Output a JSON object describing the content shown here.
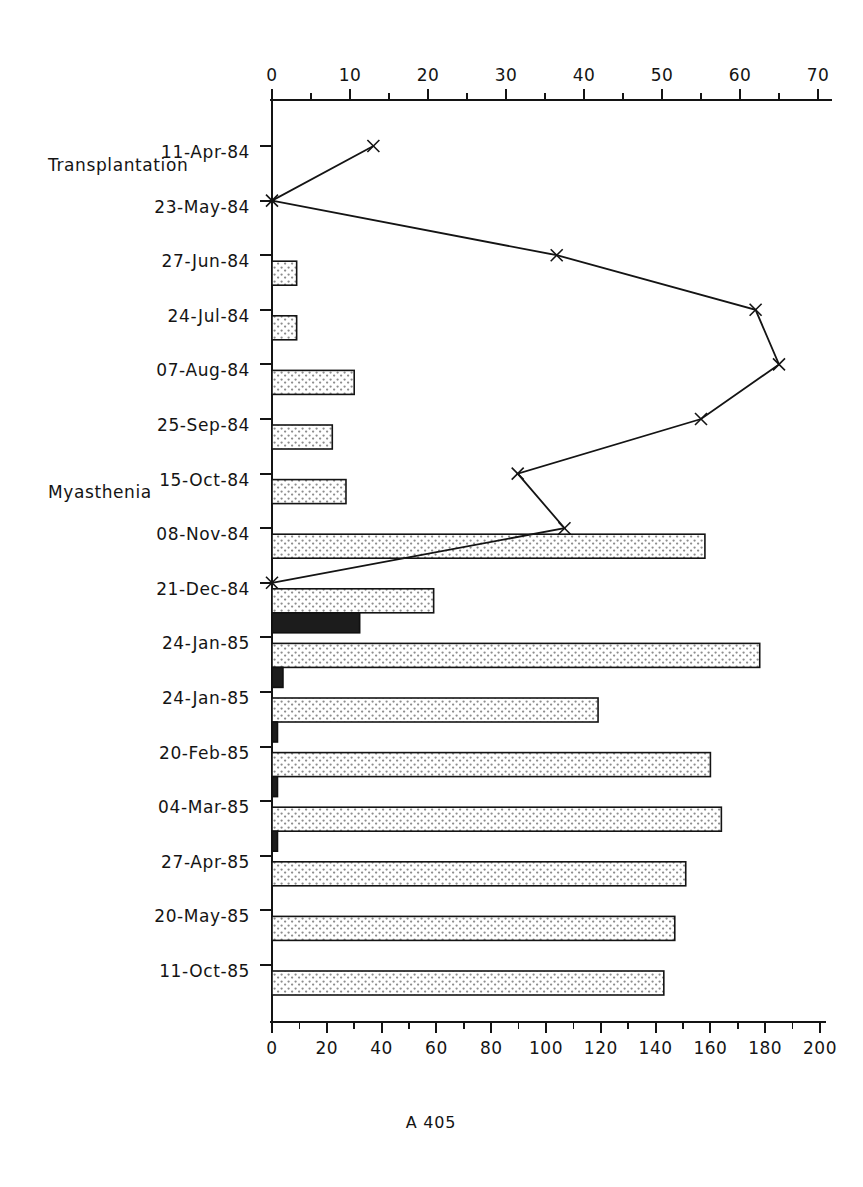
{
  "figure": {
    "caption": "A 405"
  },
  "chart_data": {
    "type": "bar",
    "title": "",
    "subtitle": "",
    "orientation": "horizontal",
    "categories": [
      "11-Apr-84",
      "23-May-84",
      "27-Jun-84",
      "24-Jul-84",
      "07-Aug-84",
      "25-Sep-84",
      "15-Oct-84",
      "08-Nov-84",
      "21-Dec-84",
      "24-Jan-85",
      "24-Jan-85",
      "20-Feb-85",
      "04-Mar-85",
      "27-Apr-85",
      "20-May-85",
      "11-Oct-85"
    ],
    "ylabel": "",
    "grid": false,
    "legend": "none",
    "bottom_axis": {
      "label": "",
      "min": 0,
      "max": 200,
      "major_step": 20,
      "minor_step": 10,
      "ticks": [
        0,
        20,
        40,
        60,
        80,
        100,
        120,
        140,
        160,
        180,
        200
      ],
      "tick_labels": [
        "0",
        "20",
        "40",
        "60",
        "80",
        "100",
        "120",
        "140",
        "160",
        "180",
        "200"
      ]
    },
    "top_axis": {
      "label": "",
      "min": 0,
      "max": 70,
      "major_step": 10,
      "minor_step": 5,
      "ticks": [
        0,
        10,
        20,
        30,
        40,
        50,
        60,
        70
      ],
      "tick_labels": [
        "0",
        "10",
        "20",
        "30",
        "40",
        "50",
        "60",
        "70"
      ]
    },
    "series": [
      {
        "name": "light-bar",
        "style": "stippled",
        "axis": "bottom",
        "values": [
          null,
          null,
          9,
          9,
          30,
          22,
          27,
          158,
          59,
          178,
          119,
          160,
          164,
          151,
          147,
          143
        ]
      },
      {
        "name": "dark-bar",
        "style": "solid-dark",
        "axis": "bottom",
        "values": [
          null,
          null,
          null,
          null,
          null,
          null,
          null,
          null,
          32,
          4,
          2,
          2,
          2,
          null,
          null,
          null
        ]
      },
      {
        "name": "line-marker",
        "style": "line-with-x-markers",
        "axis": "top",
        "values": [
          13,
          0,
          36.5,
          62,
          65,
          55,
          31.5,
          37.5,
          0,
          null,
          null,
          null,
          null,
          null,
          null,
          null
        ]
      }
    ],
    "annotations": [
      {
        "text": "Transplantation",
        "category": "23-May-84",
        "position": "above-left"
      },
      {
        "text": "Myasthenia",
        "category": "08-Nov-84",
        "position": "above-left"
      }
    ]
  }
}
